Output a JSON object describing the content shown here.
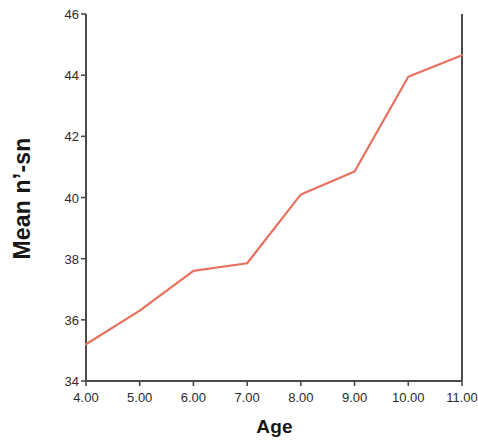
{
  "chart_data": {
    "type": "line",
    "title": "",
    "xlabel": "Age",
    "ylabel": "Mean n’-sn",
    "x": [
      4,
      5,
      6,
      7,
      8,
      9,
      10,
      11
    ],
    "values": [
      35.2,
      36.3,
      37.6,
      37.85,
      40.1,
      40.85,
      43.95,
      44.65
    ],
    "series": [
      {
        "name": "Mean n’-sn",
        "values": [
          35.2,
          36.3,
          37.6,
          37.85,
          40.1,
          40.85,
          43.95,
          44.65
        ],
        "color": "#e8705f"
      }
    ],
    "xtick_labels": [
      "4.00",
      "5.00",
      "6.00",
      "7.00",
      "8.00",
      "9.00",
      "10.00",
      "11.00"
    ],
    "ytick_labels": [
      "34",
      "36",
      "38",
      "40",
      "42",
      "44",
      "46"
    ],
    "ytick_values": [
      34,
      36,
      38,
      40,
      42,
      44,
      46
    ],
    "xlim": [
      4,
      11
    ],
    "ylim": [
      34,
      46
    ],
    "grid": false,
    "legend": false,
    "legend_position": "none",
    "line_color": "#e8705f",
    "axis_color": "#4a4a4a",
    "background": "#ffffff"
  }
}
